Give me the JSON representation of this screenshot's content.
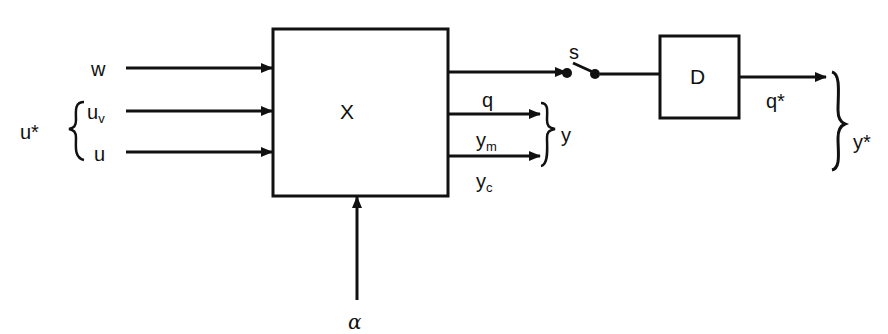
{
  "diagram": {
    "blocks": {
      "system": {
        "label": "X"
      },
      "delay": {
        "label": "D"
      }
    },
    "inputs": {
      "w": "w",
      "uv_main": "u",
      "uv_sub": "v",
      "u": "u",
      "group_label": "u*"
    },
    "outputs": {
      "q": "q",
      "ym_main": "y",
      "ym_sub": "m",
      "yc_main": "y",
      "yc_sub": "c",
      "group_label": "y"
    },
    "parameter": {
      "alpha": "α"
    },
    "switch": {
      "label": "s"
    },
    "delayed_output": {
      "q_star": "q*",
      "group_label": "y*"
    },
    "colors": {
      "stroke": "#111111",
      "background": "#ffffff"
    }
  }
}
